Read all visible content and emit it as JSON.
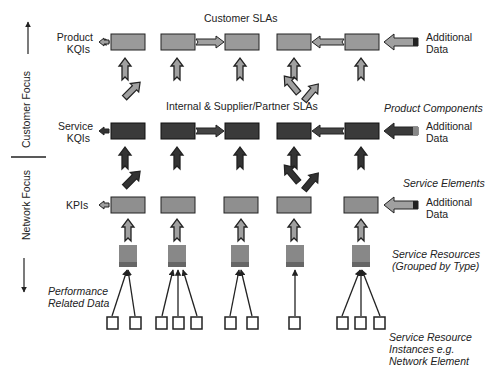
{
  "axis": {
    "customer_focus": "Customer Focus",
    "network_focus": "Network Focus"
  },
  "rows": {
    "product_kqis": {
      "label_line1": "Product",
      "label_line2": "KQIs",
      "sla_title": "Customer SLAs"
    },
    "service_kqis": {
      "label_line1": "Service",
      "label_line2": "KQIs",
      "sla_title": "Internal & Supplier/Partner SLAs"
    },
    "kpis": {
      "label": "KPIs"
    }
  },
  "right_labels": {
    "additional_data_1": {
      "line1": "Additional",
      "line2": "Data"
    },
    "additional_data_2": {
      "line1": "Additional",
      "line2": "Data"
    },
    "additional_data_3": {
      "line1": "Additional",
      "line2": "Data"
    },
    "product_components": "Product Components",
    "service_elements": "Service Elements",
    "service_resources": {
      "line1": "Service Resources",
      "line2": "(Grouped by Type)"
    },
    "resource_instances": {
      "line1": "Service Resource",
      "line2": "Instances e.g.",
      "line3": "Network Element"
    }
  },
  "left_labels": {
    "performance_data": {
      "line1": "Performance",
      "line2": "Related Data"
    }
  },
  "colors": {
    "product_box": "#9a9a9a",
    "service_box": "#3a3a3a",
    "kpi_box": "#8f8f8f",
    "resource_box": "#8a8a8a",
    "stroke": "#222222"
  }
}
